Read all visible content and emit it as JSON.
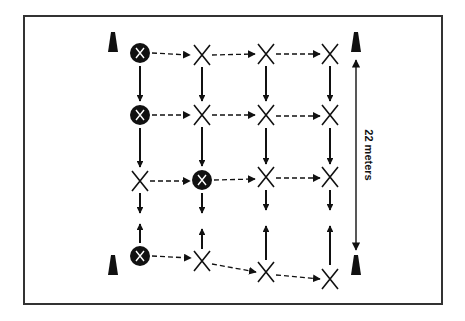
{
  "diagram": {
    "type": "drill-layout",
    "frame": {
      "x": 24,
      "y": 16,
      "width": 418,
      "height": 288,
      "stroke": "#333333"
    },
    "colors": {
      "ink": "#111111",
      "background": "#ffffff"
    },
    "measurement": {
      "label": "22 meters",
      "x": 356,
      "y1": 60,
      "y2": 250
    },
    "cones": [
      {
        "x": 113,
        "y": 42
      },
      {
        "x": 113,
        "y": 265
      },
      {
        "x": 356,
        "y": 42
      },
      {
        "x": 356,
        "y": 265
      }
    ],
    "players": [
      {
        "id": "r1c1",
        "x": 140,
        "y": 53,
        "type": "filled-circle-x",
        "label": "X"
      },
      {
        "id": "r1c2",
        "x": 202,
        "y": 55,
        "type": "x",
        "label": "X"
      },
      {
        "id": "r1c3",
        "x": 266,
        "y": 54,
        "type": "x",
        "label": "X"
      },
      {
        "id": "r1c4",
        "x": 330,
        "y": 54,
        "type": "x",
        "label": "X"
      },
      {
        "id": "r2c1",
        "x": 140,
        "y": 115,
        "type": "filled-circle-x",
        "label": "X"
      },
      {
        "id": "r2c2",
        "x": 202,
        "y": 115,
        "type": "x",
        "label": "X"
      },
      {
        "id": "r2c3",
        "x": 266,
        "y": 115,
        "type": "x",
        "label": "X"
      },
      {
        "id": "r2c4",
        "x": 330,
        "y": 115,
        "type": "x",
        "label": "X"
      },
      {
        "id": "r3c1",
        "x": 140,
        "y": 181,
        "type": "x",
        "label": "X"
      },
      {
        "id": "r3c2",
        "x": 202,
        "y": 180,
        "type": "filled-circle-x",
        "label": "X"
      },
      {
        "id": "r3c3",
        "x": 266,
        "y": 177,
        "type": "x",
        "label": "X"
      },
      {
        "id": "r3c4",
        "x": 330,
        "y": 177,
        "type": "x",
        "label": "X"
      },
      {
        "id": "r4c1",
        "x": 140,
        "y": 256,
        "type": "filled-circle-x",
        "label": "X"
      },
      {
        "id": "r4c2",
        "x": 202,
        "y": 261,
        "type": "x",
        "label": "X"
      },
      {
        "id": "r4c3",
        "x": 266,
        "y": 272,
        "type": "x",
        "label": "X"
      },
      {
        "id": "r4c4",
        "x": 330,
        "y": 279,
        "type": "x",
        "label": "X"
      }
    ],
    "passes_dashed": [
      {
        "x1": 152,
        "y1": 53,
        "x2": 190,
        "y2": 55
      },
      {
        "x1": 212,
        "y1": 55,
        "x2": 255,
        "y2": 54
      },
      {
        "x1": 276,
        "y1": 54,
        "x2": 320,
        "y2": 54
      },
      {
        "x1": 152,
        "y1": 115,
        "x2": 190,
        "y2": 115
      },
      {
        "x1": 212,
        "y1": 115,
        "x2": 255,
        "y2": 115
      },
      {
        "x1": 276,
        "y1": 116,
        "x2": 320,
        "y2": 116
      },
      {
        "x1": 150,
        "y1": 181,
        "x2": 190,
        "y2": 181
      },
      {
        "x1": 214,
        "y1": 180,
        "x2": 255,
        "y2": 179
      },
      {
        "x1": 276,
        "y1": 178,
        "x2": 320,
        "y2": 178
      },
      {
        "x1": 152,
        "y1": 256,
        "x2": 191,
        "y2": 258
      },
      {
        "x1": 212,
        "y1": 264,
        "x2": 256,
        "y2": 272
      },
      {
        "x1": 276,
        "y1": 275,
        "x2": 320,
        "y2": 279
      }
    ],
    "runs_solid": [
      {
        "x1": 140,
        "y1": 66,
        "x2": 140,
        "y2": 101
      },
      {
        "x1": 202,
        "y1": 67,
        "x2": 202,
        "y2": 101
      },
      {
        "x1": 266,
        "y1": 66,
        "x2": 266,
        "y2": 101
      },
      {
        "x1": 330,
        "y1": 66,
        "x2": 330,
        "y2": 101
      },
      {
        "x1": 140,
        "y1": 128,
        "x2": 140,
        "y2": 167
      },
      {
        "x1": 202,
        "y1": 127,
        "x2": 202,
        "y2": 166
      },
      {
        "x1": 266,
        "y1": 128,
        "x2": 266,
        "y2": 164
      },
      {
        "x1": 330,
        "y1": 128,
        "x2": 330,
        "y2": 164
      },
      {
        "x1": 140,
        "y1": 193,
        "x2": 140,
        "y2": 213
      },
      {
        "x1": 202,
        "y1": 193,
        "x2": 202,
        "y2": 213
      },
      {
        "x1": 266,
        "y1": 190,
        "x2": 266,
        "y2": 210
      },
      {
        "x1": 330,
        "y1": 190,
        "x2": 330,
        "y2": 210
      },
      {
        "x1": 140,
        "y1": 243,
        "x2": 140,
        "y2": 224
      },
      {
        "x1": 202,
        "y1": 249,
        "x2": 202,
        "y2": 229
      },
      {
        "x1": 266,
        "y1": 260,
        "x2": 266,
        "y2": 226
      },
      {
        "x1": 330,
        "y1": 265,
        "x2": 330,
        "y2": 226
      }
    ]
  }
}
